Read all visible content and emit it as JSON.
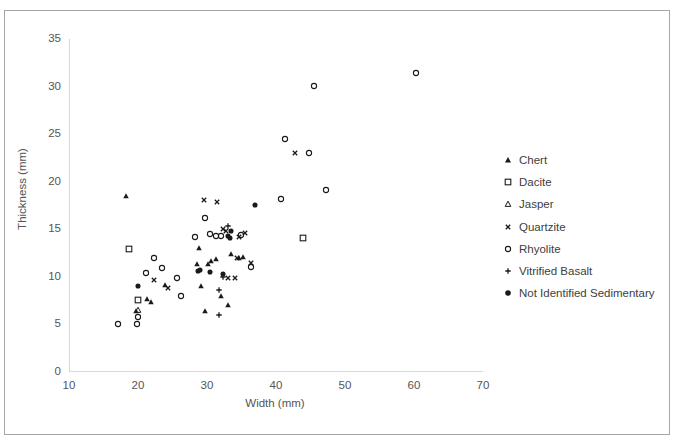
{
  "chart_data": {
    "type": "scatter",
    "title": "",
    "xlabel": "Width (mm)",
    "ylabel": "Thickness (mm)",
    "xlim": [
      10,
      70
    ],
    "ylim": [
      0,
      35
    ],
    "xticks": [
      10,
      20,
      30,
      40,
      50,
      60,
      70
    ],
    "yticks": [
      0,
      5,
      10,
      15,
      20,
      25,
      30,
      35
    ],
    "grid": false,
    "legend_position": "right",
    "series": [
      {
        "name": "Chert",
        "marker": "filled-triangle",
        "color": "#1a1a1a",
        "points": [
          [
            18.3,
            18.5
          ],
          [
            19.7,
            6.4
          ],
          [
            21.3,
            7.6
          ],
          [
            21.9,
            7.3
          ],
          [
            23.9,
            9.1
          ],
          [
            28.5,
            11.3
          ],
          [
            28.9,
            13.0
          ],
          [
            29.2,
            9.0
          ],
          [
            29.7,
            6.4
          ],
          [
            30.1,
            11.3
          ],
          [
            30.6,
            11.6
          ],
          [
            31.3,
            11.8
          ],
          [
            32.1,
            8.0
          ],
          [
            33.1,
            7.0
          ],
          [
            33.5,
            12.4
          ],
          [
            34.7,
            11.9
          ],
          [
            35.2,
            12.1
          ]
        ]
      },
      {
        "name": "Dacite",
        "marker": "open-square",
        "color": "#1a1a1a",
        "points": [
          [
            18.7,
            12.9
          ],
          [
            20.0,
            7.5
          ],
          [
            43.9,
            14.1
          ]
        ]
      },
      {
        "name": "Jasper",
        "marker": "open-triangle",
        "color": "#1a1a1a",
        "points": [
          [
            20.0,
            6.5
          ]
        ]
      },
      {
        "name": "Quartzite",
        "marker": "cross-x",
        "color": "#1a1a1a",
        "points": [
          [
            22.3,
            9.6
          ],
          [
            24.4,
            8.8
          ],
          [
            29.5,
            18.1
          ],
          [
            31.5,
            17.8
          ],
          [
            32.3,
            15.0
          ],
          [
            32.7,
            14.8
          ],
          [
            33.1,
            9.8
          ],
          [
            34.0,
            9.8
          ],
          [
            34.3,
            11.9
          ],
          [
            34.6,
            14.2
          ],
          [
            35.5,
            14.6
          ],
          [
            36.4,
            11.4
          ],
          [
            42.7,
            23.0
          ]
        ]
      },
      {
        "name": "Rhyolite",
        "marker": "open-circle",
        "color": "#1a1a1a",
        "points": [
          [
            17.1,
            5.0
          ],
          [
            19.9,
            5.0
          ],
          [
            20.0,
            5.7
          ],
          [
            21.1,
            10.4
          ],
          [
            22.3,
            12.0
          ],
          [
            23.5,
            10.9
          ],
          [
            25.6,
            9.8
          ],
          [
            26.3,
            7.9
          ],
          [
            28.3,
            14.2
          ],
          [
            29.7,
            16.2
          ],
          [
            30.5,
            14.5
          ],
          [
            31.3,
            14.3
          ],
          [
            32.1,
            14.3
          ],
          [
            34.9,
            14.4
          ],
          [
            36.4,
            11.0
          ],
          [
            40.7,
            18.2
          ],
          [
            41.3,
            24.5
          ],
          [
            44.8,
            23.0
          ],
          [
            45.5,
            30.1
          ],
          [
            47.2,
            19.1
          ],
          [
            60.3,
            31.4
          ]
        ]
      },
      {
        "name": "Vitrified Basalt",
        "marker": "plus",
        "color": "#1a1a1a",
        "points": [
          [
            31.7,
            8.6
          ],
          [
            31.7,
            5.9
          ],
          [
            32.3,
            9.9
          ],
          [
            33.1,
            15.3
          ]
        ]
      },
      {
        "name": "Not Identified Sedimentary",
        "marker": "filled-circle",
        "color": "#1a1a1a",
        "points": [
          [
            20.0,
            9.0
          ],
          [
            28.7,
            10.6
          ],
          [
            29.0,
            10.7
          ],
          [
            30.5,
            10.5
          ],
          [
            32.3,
            10.3
          ],
          [
            33.1,
            14.3
          ],
          [
            33.3,
            14.1
          ],
          [
            33.5,
            14.8
          ],
          [
            36.9,
            17.5
          ]
        ]
      }
    ]
  },
  "legend": {
    "items": [
      {
        "label": "Chert",
        "marker": "filled-triangle"
      },
      {
        "label": "Dacite",
        "marker": "open-square"
      },
      {
        "label": "Jasper",
        "marker": "open-triangle"
      },
      {
        "label": "Quartzite",
        "marker": "cross-x"
      },
      {
        "label": "Rhyolite",
        "marker": "open-circle"
      },
      {
        "label": "Vitrified Basalt",
        "marker": "plus"
      },
      {
        "label": "Not Identified Sedimentary",
        "marker": "filled-circle"
      }
    ]
  },
  "colors": {
    "marker": "#1a1a1a",
    "axis": "#d9d9d9",
    "text": "#555555",
    "frame": "#a6a6a6"
  }
}
